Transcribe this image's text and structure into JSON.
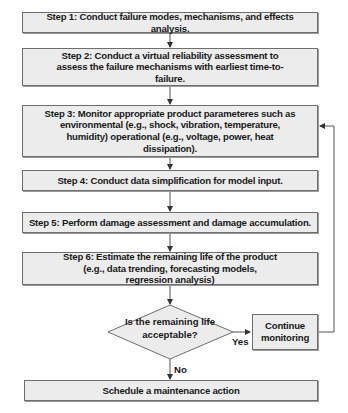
{
  "flowchart": {
    "steps": [
      {
        "id": "step1",
        "label": "Step 1: Conduct failure modes, mechanisms, and effects analysis."
      },
      {
        "id": "step2",
        "label": "Step 2: Conduct a virtual reliability assessment to assess the failure mechanisms with earliest time-to-failure."
      },
      {
        "id": "step3",
        "label": "Step 3: Monitor appropriate product parameteres such as environmental (e.g., shock, vibration, temperature, humidity) operational (e.g., voltage, power, heat dissipation)."
      },
      {
        "id": "step4",
        "label": "Step 4: Conduct data simplification for model input."
      },
      {
        "id": "step5",
        "label": "Step 5: Perform damage assessment and damage accumulation."
      },
      {
        "id": "step6",
        "label": "Step 6: Estimate the remaining life of the product (e.g., data trending, forecasting models, regression analysis)"
      }
    ],
    "decision": {
      "label": "Is the remaining life acceptable?",
      "yes_label": "Yes",
      "no_label": "No"
    },
    "continue_box": {
      "label": "Continue monitoring"
    },
    "final_box": {
      "label": "Schedule a maintenance action"
    },
    "colors": {
      "box_fill": "#ececec",
      "border": "#6e6e6e",
      "line": "#555555",
      "text": "#1a1a1a"
    }
  }
}
